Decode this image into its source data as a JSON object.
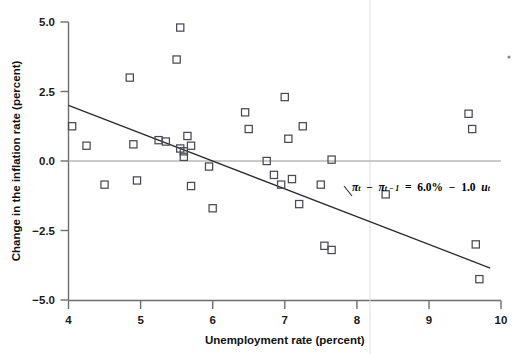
{
  "chart_data": {
    "type": "scatter",
    "title": "",
    "xlabel": "Unemployment rate (percent)",
    "ylabel": "Change in the inflation rate (percent)",
    "xlim": [
      4,
      10
    ],
    "ylim": [
      -5.0,
      5.0
    ],
    "xticks": [
      4,
      5,
      6,
      7,
      8,
      9,
      10
    ],
    "xticklabels": [
      "4",
      "5",
      "6",
      "7",
      "8",
      "9",
      "10"
    ],
    "yticks": [
      5.0,
      2.5,
      0.0,
      -2.5,
      -5.0
    ],
    "yticklabels": [
      "5.0",
      "2.5",
      "0.0",
      "−2.5",
      "−5.0"
    ],
    "grid": false,
    "legend": null,
    "marker_style": "open-square",
    "zero_reference_line": 0.0,
    "points": [
      {
        "x": 4.05,
        "y": 1.25
      },
      {
        "x": 4.25,
        "y": 0.55
      },
      {
        "x": 4.5,
        "y": -0.85
      },
      {
        "x": 4.85,
        "y": 3.0
      },
      {
        "x": 4.9,
        "y": 0.6
      },
      {
        "x": 4.95,
        "y": -0.7
      },
      {
        "x": 5.25,
        "y": 0.75
      },
      {
        "x": 5.35,
        "y": 0.7
      },
      {
        "x": 5.5,
        "y": 3.65
      },
      {
        "x": 5.55,
        "y": 4.8
      },
      {
        "x": 5.55,
        "y": 0.45
      },
      {
        "x": 5.6,
        "y": 0.35
      },
      {
        "x": 5.6,
        "y": 0.15
      },
      {
        "x": 5.65,
        "y": 0.9
      },
      {
        "x": 5.7,
        "y": 0.55
      },
      {
        "x": 5.7,
        "y": -0.9
      },
      {
        "x": 5.95,
        "y": -0.2
      },
      {
        "x": 6.0,
        "y": -1.7
      },
      {
        "x": 6.45,
        "y": 1.75
      },
      {
        "x": 6.5,
        "y": 1.15
      },
      {
        "x": 6.75,
        "y": 0.0
      },
      {
        "x": 6.85,
        "y": -0.5
      },
      {
        "x": 6.95,
        "y": -0.85
      },
      {
        "x": 7.0,
        "y": 2.3
      },
      {
        "x": 7.05,
        "y": 0.8
      },
      {
        "x": 7.1,
        "y": -0.65
      },
      {
        "x": 7.2,
        "y": -1.55
      },
      {
        "x": 7.25,
        "y": 1.25
      },
      {
        "x": 7.5,
        "y": -0.85
      },
      {
        "x": 7.55,
        "y": -3.05
      },
      {
        "x": 7.65,
        "y": -3.2
      },
      {
        "x": 7.65,
        "y": 0.05
      },
      {
        "x": 8.4,
        "y": -1.2
      },
      {
        "x": 9.55,
        "y": 1.7
      },
      {
        "x": 9.6,
        "y": 1.15
      },
      {
        "x": 9.65,
        "y": -3.0
      },
      {
        "x": 9.7,
        "y": -4.25
      }
    ],
    "regression_line": {
      "intercept": 6.0,
      "slope": -1.0,
      "x_start": 4.0,
      "x_end": 9.85,
      "y_start": 2.0,
      "y_end": -3.85,
      "annotation": {
        "text": "πt − πt−1 = 6.0% − 1.0 ut",
        "parts": {
          "pi1": "π",
          "sub1": "t",
          "minus1": "−",
          "pi2": "π",
          "sub2": "t − 1",
          "equals": "=",
          "intercept": "6.0%",
          "minus2": "−",
          "slope": "1.0",
          "uvar": "u",
          "sub3": "t"
        }
      }
    }
  },
  "axes": {
    "x_title": "Unemployment rate (percent)",
    "y_title": "Change in the inflation rate (percent)"
  }
}
